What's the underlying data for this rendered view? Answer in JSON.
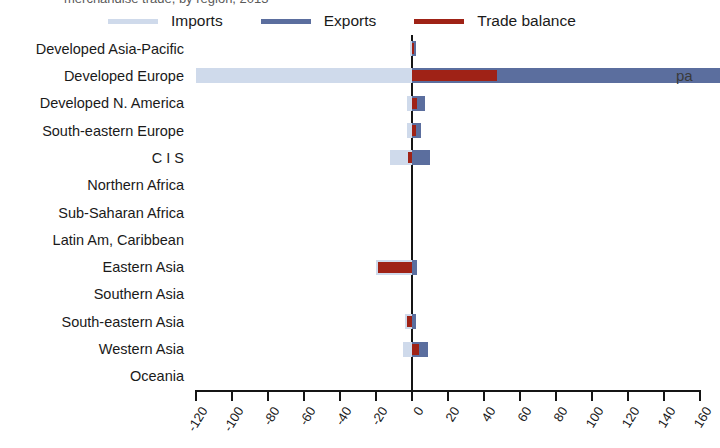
{
  "top_caption_clipped": "merchandise trade, by region, 2013",
  "legend": {
    "position": "top",
    "items": [
      {
        "label": "Imports",
        "color": "#cfdaeb",
        "icon": "line-swatch-icon"
      },
      {
        "label": "Exports",
        "color": "#5b6e9e",
        "icon": "line-swatch-icon"
      },
      {
        "label": "Trade balance",
        "color": "#9f2216",
        "icon": "line-swatch-icon"
      }
    ]
  },
  "edge_clipped_text": "pa",
  "chart_data": {
    "type": "bar",
    "orientation": "horizontal",
    "title": "",
    "subtitle": "",
    "xlabel": "",
    "ylabel": "",
    "xlim": [
      -120,
      160
    ],
    "xticks": [
      -120,
      -100,
      -80,
      -60,
      -40,
      -20,
      0,
      20,
      40,
      60,
      80,
      100,
      120,
      140,
      160
    ],
    "xtick_labels": [
      "-120",
      "-100",
      "-80",
      "-60",
      "-40",
      "-20",
      "0",
      "20",
      "40",
      "60",
      "80",
      "100",
      "120",
      "140",
      "160"
    ],
    "grid": false,
    "legend_position": "top",
    "categories": [
      "Developed Asia-Pacific",
      "Developed Europe",
      "Developed N. America",
      "South-eastern Europe",
      "C I S",
      "Northern Africa",
      "Sub-Saharan Africa",
      "Latin Am, Caribbean",
      "Eastern Asia",
      "Southern Asia",
      "South-eastern Asia",
      "Western Asia",
      "Oceania"
    ],
    "series": [
      {
        "name": "Imports",
        "color": "#cfdaeb",
        "values": [
          -1,
          -120,
          -3,
          -3,
          -12,
          0,
          0,
          0,
          -20,
          0,
          -4,
          -5,
          0
        ]
      },
      {
        "name": "Exports",
        "color": "#5b6e9e",
        "values": [
          2,
          171,
          7,
          5,
          10,
          0,
          0,
          0,
          3,
          0,
          2,
          9,
          0
        ]
      },
      {
        "name": "Trade balance",
        "color": "#9f2216",
        "values": [
          1,
          47,
          3,
          2,
          -2,
          0,
          0,
          0,
          -19,
          0,
          -3,
          4,
          0
        ]
      }
    ]
  }
}
